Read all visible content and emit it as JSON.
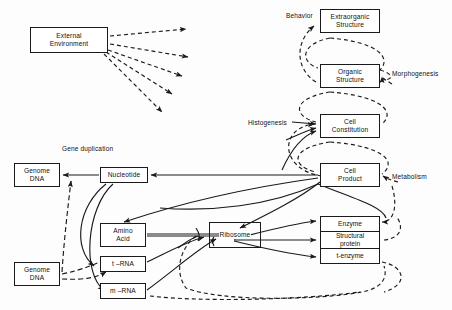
{
  "diagram": {
    "type": "flow-diagram",
    "background": "#fdfdfd",
    "stroke": "#1a1a1a",
    "nodes": [
      {
        "id": "external-environment",
        "lines": [
          "External",
          "Environment"
        ],
        "x": 30,
        "y": 27,
        "w": 78,
        "h": 26
      },
      {
        "id": "extraorganic-structure",
        "lines": [
          "Extraorganic",
          "Structure"
        ],
        "x": 320,
        "y": 9,
        "w": 60,
        "h": 24
      },
      {
        "id": "organic-structure",
        "lines": [
          "Organic",
          "Structure"
        ],
        "x": 320,
        "y": 64,
        "w": 60,
        "h": 24
      },
      {
        "id": "cell-constitution",
        "lines": [
          "Cell",
          "Constitution"
        ],
        "x": 320,
        "y": 114,
        "w": 60,
        "h": 24
      },
      {
        "id": "cell-product",
        "lines": [
          "Cell",
          "Product"
        ],
        "x": 320,
        "y": 163,
        "w": 60,
        "h": 24
      },
      {
        "id": "genome-dna-top",
        "lines": [
          "Genome",
          "DNA"
        ],
        "x": 14,
        "y": 163,
        "w": 46,
        "h": 24
      },
      {
        "id": "genome-dna-bottom",
        "lines": [
          "Genome",
          "DNA"
        ],
        "x": 14,
        "y": 262,
        "w": 46,
        "h": 24
      },
      {
        "id": "nucleotide",
        "lines": [
          "Nucleotide"
        ],
        "x": 100,
        "y": 167,
        "w": 48,
        "h": 16
      },
      {
        "id": "amino-acid",
        "lines": [
          "Amino",
          "Acid"
        ],
        "x": 100,
        "y": 223,
        "w": 46,
        "h": 24
      },
      {
        "id": "t-rna",
        "lines": [
          "t –RNA"
        ],
        "x": 100,
        "y": 256,
        "w": 46,
        "h": 16
      },
      {
        "id": "m-rna",
        "lines": [
          "m –RNA"
        ],
        "x": 100,
        "y": 283,
        "w": 46,
        "h": 16
      },
      {
        "id": "ribosome",
        "lines": [
          "Ribosome"
        ],
        "x": 209,
        "y": 222,
        "w": 52,
        "h": 26
      }
    ],
    "stacks": [
      {
        "id": "enzyme-stack",
        "x": 320,
        "y": 216,
        "w": 60,
        "h": 48,
        "cells": [
          {
            "id": "enzyme",
            "lines": [
              "Enzyme"
            ]
          },
          {
            "id": "structural-protein",
            "lines": [
              "Structural",
              "protein"
            ]
          },
          {
            "id": "t-enzyme",
            "lines": [
              "t-enzyme"
            ]
          }
        ]
      }
    ],
    "labels": [
      {
        "id": "behavior",
        "text": "Behavior",
        "x": 286,
        "y": 12,
        "italic": false
      },
      {
        "id": "morphogenesis",
        "text": "Morphogenesis",
        "x": 392,
        "y": 70,
        "italic": false
      },
      {
        "id": "histogenesis",
        "text": "Histogenesis",
        "x": 248,
        "y": 119,
        "italic": false
      },
      {
        "id": "metabolism",
        "text": "Metabolism",
        "x": 392,
        "y": 173,
        "italic": false
      }
    ],
    "multiline_labels": [
      {
        "id": "gene-duplication",
        "lines": [
          "Gene",
          "duplication"
        ],
        "x": 62,
        "y": 145
      }
    ],
    "edge_styles": {
      "solid": {
        "dash": "none",
        "width": 1.2
      },
      "dashed": {
        "dash": "4,3",
        "width": 1.2
      }
    },
    "edge_groups": [
      {
        "id": "environment-fan",
        "style": "dashed",
        "count": 5,
        "from": "external-environment",
        "note": "five dashed arrows fanning to the right and down"
      },
      {
        "id": "morphogenesis-chain",
        "style": "dashed",
        "note": "nested dashed loops linking cell product, cell constitution, organic structure, extraorganic structure"
      },
      {
        "id": "histogenesis-inputs",
        "style": "solid",
        "note": "solid arrows into cell constitution"
      },
      {
        "id": "transcription-translation",
        "style": "solid",
        "note": "solid arcs among nucleotide, genome DNA, RNAs, ribosome, enzymes"
      },
      {
        "id": "enzyme-feedback",
        "style": "dashed",
        "note": "dashed feedback from t-enzyme around to ribosome region"
      }
    ]
  }
}
